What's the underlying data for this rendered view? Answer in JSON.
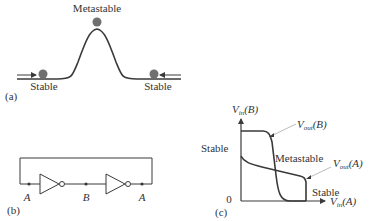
{
  "colors": {
    "line": "#3a3a3a",
    "ball": "#707070",
    "leader": "#aaaaaa",
    "text": "#333333"
  },
  "panel_a": {
    "tag": "(a)",
    "top_label": "Metastable",
    "left_label": "Stable",
    "right_label": "Stable"
  },
  "panel_b": {
    "tag": "(b)",
    "node_labels": [
      "A",
      "B",
      "A"
    ]
  },
  "panel_c": {
    "tag": "(c)",
    "y_axis": {
      "main": "V",
      "sub": "in",
      "arg": "(B)"
    },
    "x_axis": {
      "main": "V",
      "sub": "in",
      "arg": "(A)"
    },
    "origin_label": "0",
    "curve_b_label": {
      "main": "V",
      "sub": "out",
      "arg": "(B)"
    },
    "curve_a_label": {
      "main": "V",
      "sub": "out",
      "arg": "(A)"
    },
    "stable_top_label": "Stable",
    "metastable_label": "Metastable",
    "stable_bottom_label": "Stable"
  }
}
